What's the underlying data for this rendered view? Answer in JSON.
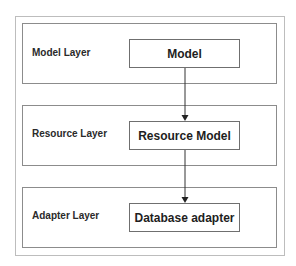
{
  "diagram": {
    "type": "layered-architecture",
    "layers": [
      {
        "label": "Model Layer",
        "node": "Model"
      },
      {
        "label": "Resource Layer",
        "node": "Resource Model"
      },
      {
        "label": "Adapter Layer",
        "node": "Database adapter"
      }
    ],
    "edges": [
      {
        "from": "Model",
        "to": "Resource Model"
      },
      {
        "from": "Resource Model",
        "to": "Database adapter"
      }
    ],
    "colors": {
      "outer_border": "#bdbdbd",
      "layer_border": "#8c8c8c",
      "node_border": "#6f6f6f",
      "arrow": "#333333"
    }
  }
}
